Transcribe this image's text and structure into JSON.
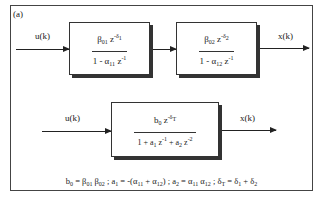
{
  "panel_label": "(a)",
  "top_row": {
    "input_signal": "u(k)",
    "output_signal": "x(k)",
    "block1": {
      "numerator": {
        "coef": "β",
        "coef_sub": "01",
        "var": "z",
        "exp": "-δ",
        "exp_sub": "1"
      },
      "denominator": {
        "lead": "1 - α",
        "coef_sub": "11",
        "var": "z",
        "exp": "-1"
      }
    },
    "block2": {
      "numerator": {
        "coef": "β",
        "coef_sub": "02",
        "var": "z",
        "exp": "-δ",
        "exp_sub": "2"
      },
      "denominator": {
        "lead": "1 - α",
        "coef_sub": "12",
        "var": "z",
        "exp": "-1"
      }
    }
  },
  "bottom_row": {
    "input_signal": "u(k)",
    "output_signal": "x(k)",
    "block": {
      "numerator": {
        "coef": "b",
        "coef_sub": "0",
        "var": "z",
        "exp": "-δ",
        "exp_sub": "T"
      },
      "denominator": {
        "t1": "1 + a",
        "t1_sub": "1",
        "t1_var": "z",
        "t1_exp": "-1",
        "t2": "+ a",
        "t2_sub": "2",
        "t2_var": "z",
        "t2_exp": "-2"
      }
    }
  },
  "formula": {
    "p1": "b",
    "p1_sub": "0",
    "p1_eq": " = β",
    "p1_s1": "01",
    "p1_b": " β",
    "p1_s2": "02",
    "sep1": " ;  a",
    "p2_sub": "1",
    "p2_eq": " = -(α",
    "p2_s1": "11",
    "p2_plus": " + α",
    "p2_s2": "12",
    "p2_close": ")",
    "sep2": " ;  a",
    "p3_sub": "2",
    "p3_eq": " = α",
    "p3_s1": "11",
    "p3_a": " α",
    "p3_s2": "12",
    "sep3": " ;  δ",
    "p4_sub": "T",
    "p4_eq": " = δ",
    "p4_s1": "1",
    "p4_plus": " + δ",
    "p4_s2": "2"
  }
}
